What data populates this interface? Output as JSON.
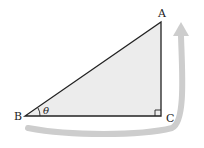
{
  "diagram": {
    "type": "right-triangle",
    "vertices": {
      "A": "A",
      "B": "B",
      "C": "C"
    },
    "angle_label": "θ",
    "right_angle_at": "C",
    "colors": {
      "fill": "#ececec",
      "stroke": "#222222",
      "arrow": "#cccccc"
    }
  }
}
